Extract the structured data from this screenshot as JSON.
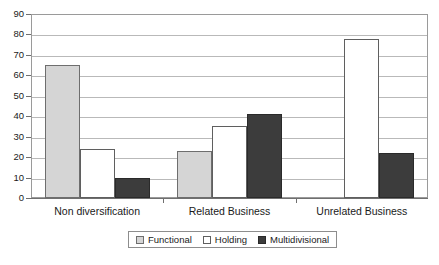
{
  "chart_data": {
    "type": "bar",
    "title": "",
    "subtitle": "",
    "xlabel": "",
    "ylabel": "",
    "ylim": [
      0,
      90
    ],
    "ytick_step": 10,
    "yticks": [
      0,
      10,
      20,
      30,
      40,
      50,
      60,
      70,
      80,
      90
    ],
    "ytick_labels": [
      "0",
      "10",
      "20",
      "30",
      "40",
      "50",
      "60",
      "70",
      "80",
      "90"
    ],
    "grid": true,
    "grid_axis": "y",
    "legend_position": "bottom",
    "categories": [
      "Non diversification",
      "Related Business",
      "Unrelated Business"
    ],
    "series": [
      {
        "name": "Functional",
        "values": [
          65,
          23,
          0
        ],
        "color": "#d5d5d5",
        "edge_color": "#6e6e6e"
      },
      {
        "name": "Holding",
        "values": [
          24,
          35,
          78
        ],
        "color": "#ffffff",
        "edge_color": "#5f5f5f"
      },
      {
        "name": "Multidivisional",
        "values": [
          10,
          41,
          22
        ],
        "color": "#3c3c3c",
        "edge_color": "#2a2a2a"
      }
    ]
  },
  "legend": {
    "entries": [
      {
        "label": "Functional"
      },
      {
        "label": "Holding"
      },
      {
        "label": "Multidivisional"
      }
    ]
  }
}
